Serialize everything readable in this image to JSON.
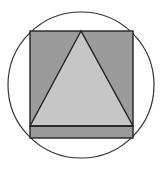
{
  "diagram": {
    "circle": {
      "cx": 81,
      "cy": 85,
      "r": 73,
      "stroke": "#333333",
      "fill": "#ffffff"
    },
    "rectangle": {
      "x": 30,
      "y": 31,
      "width": 103,
      "height": 107,
      "fill": "#9b9b9b",
      "stroke": "#222222"
    },
    "triangle": {
      "points": "81,31 30,126 133,126",
      "fill": "#c6c6c6",
      "stroke": "#222222"
    },
    "base_line": {
      "x1": 30,
      "y1": 126,
      "x2": 133,
      "y2": 126
    }
  }
}
